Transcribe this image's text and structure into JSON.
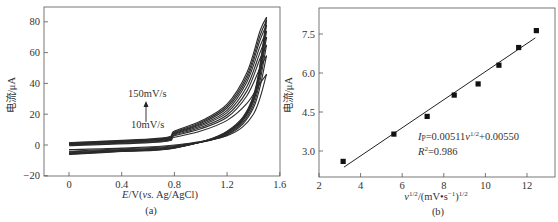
{
  "chart_data": [
    {
      "id": "a",
      "type": "line",
      "caption": "(a)",
      "title": "",
      "xlabel": "E/V(vs. Ag/AgCl)",
      "xlabel_parts": {
        "italic": "E",
        "mid": "/V(",
        "italic2": "vs.",
        "tail": " Ag/AgCl)"
      },
      "ylabel": "电流/μA",
      "xlim": [
        -0.2,
        1.6
      ],
      "ylim": [
        -20,
        90
      ],
      "xticks": [
        0,
        0.4,
        0.8,
        1.2,
        1.6
      ],
      "xtick_labels": [
        "0",
        "0.4",
        "0.8",
        "1.2",
        "1.6"
      ],
      "yticks": [
        -20,
        0,
        20,
        40,
        60,
        80
      ],
      "ytick_labels": [
        "−20",
        "0",
        "20",
        "40",
        "60",
        "80"
      ],
      "grid": false,
      "annotations": [
        {
          "text": "150mV/s",
          "x": 0.62,
          "y": 34
        },
        {
          "text": "10mV/s",
          "x": 0.6,
          "y": 12
        },
        {
          "type": "arrow",
          "from_y": 14,
          "to_y": 27,
          "x": 0.58
        }
      ],
      "series_description": "Cyclic voltammograms at scan rates from 10 to 150 mV/s; anodic current rises steeply above ~1.2 V reaching ~83 μA at 1.5 V for 150 mV/s",
      "series": [
        {
          "name": "10mV/s",
          "forward": [
            [
              0,
              -0.5
            ],
            [
              0.7,
              2
            ],
            [
              0.8,
              5
            ],
            [
              1.0,
              9
            ],
            [
              1.2,
              16
            ],
            [
              1.35,
              27
            ],
            [
              1.45,
              40
            ],
            [
              1.5,
              46
            ]
          ],
          "reverse": [
            [
              1.5,
              46
            ],
            [
              1.4,
              20
            ],
            [
              1.2,
              6
            ],
            [
              0.8,
              0
            ],
            [
              0.4,
              -2
            ],
            [
              0,
              -3
            ]
          ]
        },
        {
          "name": "30mV/s",
          "forward": [
            [
              0,
              0
            ],
            [
              0.7,
              2.5
            ],
            [
              0.8,
              6
            ],
            [
              1.0,
              10.5
            ],
            [
              1.2,
              18
            ],
            [
              1.35,
              32
            ],
            [
              1.45,
              50
            ],
            [
              1.5,
              58
            ]
          ],
          "reverse": [
            [
              1.5,
              58
            ],
            [
              1.4,
              24
            ],
            [
              1.2,
              6.5
            ],
            [
              0.8,
              -0.5
            ],
            [
              0.4,
              -2.5
            ],
            [
              0,
              -4
            ]
          ]
        },
        {
          "name": "50mV/s",
          "forward": [
            [
              0,
              0.3
            ],
            [
              0.7,
              3
            ],
            [
              0.8,
              6.5
            ],
            [
              1.0,
              11.5
            ],
            [
              1.2,
              19.5
            ],
            [
              1.35,
              35
            ],
            [
              1.45,
              56
            ],
            [
              1.5,
              65
            ]
          ],
          "reverse": [
            [
              1.5,
              65
            ],
            [
              1.4,
              26
            ],
            [
              1.2,
              7
            ],
            [
              0.8,
              -1
            ],
            [
              0.4,
              -3
            ],
            [
              0,
              -4.5
            ]
          ]
        },
        {
          "name": "70mV/s",
          "forward": [
            [
              0,
              0.6
            ],
            [
              0.7,
              3.3
            ],
            [
              0.8,
              7
            ],
            [
              1.0,
              12.5
            ],
            [
              1.2,
              21
            ],
            [
              1.35,
              38
            ],
            [
              1.45,
              60
            ],
            [
              1.5,
              70
            ]
          ],
          "reverse": [
            [
              1.5,
              70
            ],
            [
              1.4,
              28
            ],
            [
              1.2,
              7.5
            ],
            [
              0.8,
              -1.2
            ],
            [
              0.4,
              -3.3
            ],
            [
              0,
              -5
            ]
          ]
        },
        {
          "name": "90mV/s",
          "forward": [
            [
              0,
              0.9
            ],
            [
              0.7,
              3.6
            ],
            [
              0.8,
              7.5
            ],
            [
              1.0,
              13.3
            ],
            [
              1.2,
              22.5
            ],
            [
              1.35,
              41
            ],
            [
              1.45,
              64
            ],
            [
              1.5,
              74
            ]
          ],
          "reverse": [
            [
              1.5,
              74
            ],
            [
              1.4,
              29
            ],
            [
              1.2,
              8
            ],
            [
              0.8,
              -1.5
            ],
            [
              0.4,
              -3.6
            ],
            [
              0,
              -5.3
            ]
          ]
        },
        {
          "name": "110mV/s",
          "forward": [
            [
              0,
              1.1
            ],
            [
              0.7,
              3.9
            ],
            [
              0.8,
              8
            ],
            [
              1.0,
              14
            ],
            [
              1.2,
              24
            ],
            [
              1.35,
              43
            ],
            [
              1.45,
              68
            ],
            [
              1.5,
              78
            ]
          ],
          "reverse": [
            [
              1.5,
              78
            ],
            [
              1.4,
              30
            ],
            [
              1.2,
              8.3
            ],
            [
              0.8,
              -1.7
            ],
            [
              0.4,
              -3.8
            ],
            [
              0,
              -5.6
            ]
          ]
        },
        {
          "name": "130mV/s",
          "forward": [
            [
              0,
              1.3
            ],
            [
              0.7,
              4.2
            ],
            [
              0.8,
              8.5
            ],
            [
              1.0,
              14.8
            ],
            [
              1.2,
              25.3
            ],
            [
              1.35,
              45
            ],
            [
              1.45,
              71
            ],
            [
              1.5,
              81
            ]
          ],
          "reverse": [
            [
              1.5,
              81
            ],
            [
              1.4,
              31
            ],
            [
              1.2,
              8.6
            ],
            [
              0.8,
              -1.9
            ],
            [
              0.4,
              -4
            ],
            [
              0,
              -5.9
            ]
          ]
        },
        {
          "name": "150mV/s",
          "forward": [
            [
              0,
              1.5
            ],
            [
              0.7,
              4.5
            ],
            [
              0.8,
              9
            ],
            [
              1.0,
              15.5
            ],
            [
              1.2,
              26.5
            ],
            [
              1.35,
              47
            ],
            [
              1.45,
              74
            ],
            [
              1.5,
              83
            ]
          ],
          "reverse": [
            [
              1.5,
              83
            ],
            [
              1.4,
              32
            ],
            [
              1.2,
              9
            ],
            [
              0.8,
              -2
            ],
            [
              0.4,
              -4.2
            ],
            [
              0,
              -6.2
            ]
          ]
        }
      ]
    },
    {
      "id": "b",
      "type": "scatter",
      "caption": "(b)",
      "title": "",
      "xlabel": "v^1/2/(mV·s^-1)^1/2",
      "ylabel": "电流/μA",
      "xlim": [
        2,
        13.2
      ],
      "ylim": [
        2.0,
        8.5
      ],
      "xticks": [
        2,
        4,
        6,
        8,
        10,
        12
      ],
      "xtick_labels": [
        "2",
        "4",
        "6",
        "8",
        "10",
        "12"
      ],
      "yticks": [
        3.0,
        4.5,
        6.0,
        7.5
      ],
      "ytick_labels": [
        "3.0",
        "4.5",
        "6.0",
        "7.5"
      ],
      "grid": false,
      "x": [
        3.16,
        5.6,
        7.2,
        8.5,
        9.65,
        10.65,
        11.6,
        12.45
      ],
      "values": [
        2.6,
        3.65,
        4.33,
        5.15,
        5.58,
        6.3,
        6.98,
        7.63
      ],
      "fit_line": {
        "x": [
          3.2,
          12.4
        ],
        "y": [
          2.38,
          7.35
        ]
      },
      "annotations": [
        {
          "text": "Ip=0.00511v^1/2+0.00550"
        },
        {
          "text": "R²=0.986"
        }
      ]
    }
  ],
  "labels": {
    "a": {
      "ylabel": "电流/μA",
      "x_italic": "E",
      "x_rest1": "/V(",
      "x_italic2": "vs.",
      "x_rest2": " Ag/AgCl)",
      "caption": "(a)",
      "ann_high": "150mV/s",
      "ann_low": "10mV/s",
      "ticks_x": [
        "0",
        "0.4",
        "0.8",
        "1.2",
        "1.6"
      ],
      "ticks_y": [
        "80",
        "60",
        "40",
        "20",
        "0",
        "−20"
      ]
    },
    "b": {
      "ylabel": "电流/μA",
      "x_v": "v",
      "x_sup1": "1/2",
      "x_mid": "/(mV",
      "x_dot": "•",
      "x_s": "s",
      "x_sup2": "−1",
      "x_close": ")",
      "x_sup3": "1/2",
      "caption": "(b)",
      "eq_I": "I",
      "eq_p": "P",
      "eq_mid": "=0.00511",
      "eq_v": "v",
      "eq_sup": "1/2",
      "eq_tail": "+0.00550",
      "r_R": "R",
      "r_sup": "2",
      "r_tail": "=0.986",
      "ticks_x": [
        "2",
        "4",
        "6",
        "8",
        "10",
        "12"
      ],
      "ticks_y": [
        "7.5",
        "6.0",
        "4.5",
        "3.0"
      ]
    }
  },
  "colors": {
    "ink": "#222222",
    "frame": "#555555",
    "marker": "#111111"
  }
}
